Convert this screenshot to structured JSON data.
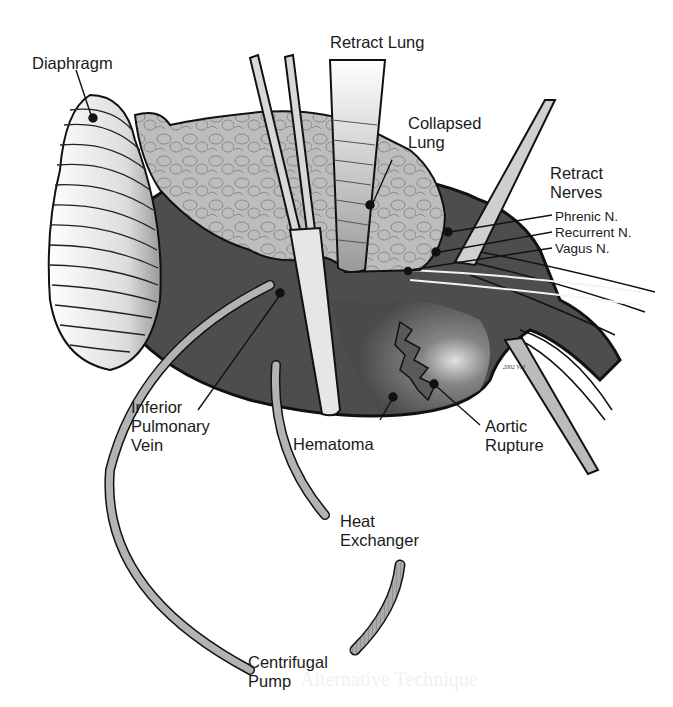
{
  "figure": {
    "type": "surgical-illustration",
    "labels": {
      "diaphragm": "Diaphragm",
      "retract_lung": "Retract Lung",
      "collapsed_lung": "Collapsed\nLung",
      "retract_nerves": "Retract\nNerves",
      "phrenic": "Phrenic N.",
      "recurrent": "Recurrent N.",
      "vagus": "Vagus N.",
      "inferior_pulmonary_vein": "Inferior\nPulmonary\nVein",
      "hematoma": "Hematoma",
      "aortic_rupture": "Aortic\nRupture",
      "heat_exchanger": "Heat\nExchanger",
      "centrifugal_pump": "Centrifugal\nPump"
    },
    "signature": "2002 Vbf",
    "background_bleed_text": "Alternative Technique",
    "colors": {
      "ink": "#111111",
      "tissue_dark": "#4a4a4a",
      "lung": "#b9b9b9",
      "diaphragm": "#e6e6e6",
      "tube": "#a9a9a9",
      "background": "#ffffff"
    }
  }
}
